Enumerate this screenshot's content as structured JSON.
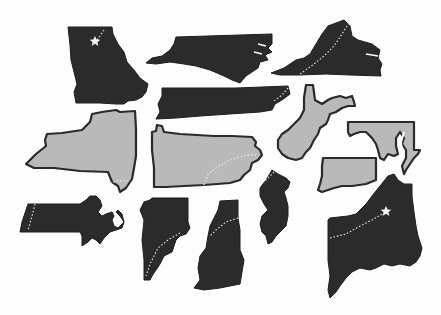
{
  "illustration": {
    "description": "Silhouettes of eastern US states",
    "colors": {
      "background": "#fdfdfd",
      "dark_fill": "#2b2b2b",
      "light_fill": "#b9b9b9",
      "outline": "#2a2a2a",
      "trail": "#e6e6e6"
    },
    "states": [
      {
        "id": "georgia",
        "fill": "dark",
        "marker": "star"
      },
      {
        "id": "north-carolina",
        "fill": "dark"
      },
      {
        "id": "virginia",
        "fill": "dark",
        "trail": true
      },
      {
        "id": "tennessee",
        "fill": "dark",
        "trail": true
      },
      {
        "id": "new-york",
        "fill": "light",
        "trail": true
      },
      {
        "id": "pennsylvania",
        "fill": "light",
        "trail": true
      },
      {
        "id": "west-virginia",
        "fill": "light"
      },
      {
        "id": "maryland",
        "fill": "light"
      },
      {
        "id": "connecticut",
        "fill": "light"
      },
      {
        "id": "massachusetts",
        "fill": "dark",
        "trail": true
      },
      {
        "id": "vermont",
        "fill": "dark",
        "trail": true
      },
      {
        "id": "new-hampshire",
        "fill": "dark",
        "trail": true
      },
      {
        "id": "new-jersey",
        "fill": "dark",
        "trail": true
      },
      {
        "id": "maine",
        "fill": "dark",
        "trail": true,
        "marker": "star"
      }
    ]
  }
}
